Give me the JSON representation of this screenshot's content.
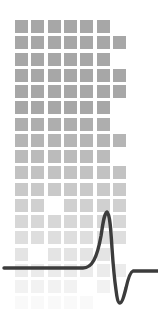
{
  "graphic": {
    "name": "pulse-grid-logo",
    "kind": "logo-mark",
    "width": 158,
    "height": 313,
    "background_color": "#ffffff",
    "description": "Grid of gray squares fading toward the bottom with a dark ECG-style spike waveform drawn across the lower third"
  },
  "grid": {
    "name": "square-grid",
    "origin_x": 15,
    "origin_y": 20,
    "pitch_x": 16.3,
    "pitch_y": 16.25,
    "square_size": 13.2,
    "columns": 7,
    "rows": 18,
    "base_color": "#a7a7a7",
    "fade_start_row": 5,
    "fade_end_row": 17,
    "fade_min_opacity": 0.07,
    "occupancy": [
      [
        1,
        1,
        1,
        1,
        1,
        1,
        0
      ],
      [
        1,
        1,
        1,
        1,
        1,
        1,
        1
      ],
      [
        1,
        1,
        1,
        1,
        1,
        1,
        0
      ],
      [
        1,
        1,
        1,
        1,
        1,
        1,
        1
      ],
      [
        1,
        1,
        1,
        1,
        1,
        1,
        1
      ],
      [
        1,
        1,
        1,
        1,
        1,
        1,
        0
      ],
      [
        1,
        1,
        1,
        1,
        1,
        1,
        0
      ],
      [
        1,
        1,
        1,
        1,
        1,
        1,
        1
      ],
      [
        1,
        1,
        1,
        1,
        1,
        1,
        0
      ],
      [
        1,
        1,
        1,
        1,
        1,
        1,
        1
      ],
      [
        1,
        1,
        1,
        1,
        1,
        1,
        1
      ],
      [
        1,
        1,
        0,
        1,
        1,
        1,
        1
      ],
      [
        1,
        1,
        1,
        1,
        1,
        1,
        1
      ],
      [
        1,
        1,
        1,
        1,
        1,
        1,
        1
      ],
      [
        1,
        0,
        1,
        1,
        1,
        1,
        0
      ],
      [
        1,
        1,
        1,
        1,
        1,
        1,
        1
      ],
      [
        1,
        1,
        1,
        1,
        0,
        1,
        0
      ],
      [
        1,
        1,
        1,
        1,
        1,
        0,
        0
      ]
    ]
  },
  "waveform": {
    "name": "pulse-waveform",
    "stroke_color": "#3c3c3c",
    "stroke_width": 3.4,
    "baseline_y": 268,
    "peak_x": 107,
    "peak_y": 212,
    "trough_x": 115,
    "trough_y": 303,
    "path": "M 4 268 L 83 268 C 92 268 97 258 101 236 C 103 223 104 214 107 212 C 110 214 111 232 112 248 C 113 263 114 276 116 290 C 117 298 118 303 120 303 C 122 303 124 296 126 288 C 128 279 130 272 133 271 L 158 271"
  }
}
